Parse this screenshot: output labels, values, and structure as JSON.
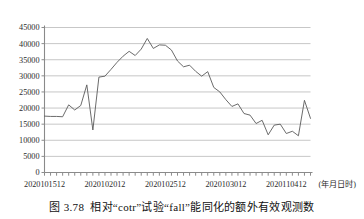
{
  "figure": {
    "caption_number": "图 3.78",
    "caption_text": "相对“cotr”试验“fall”能同化的额外有效观测数"
  },
  "chart_data": {
    "type": "line",
    "title": "",
    "xlabel": "(年月日时)",
    "ylabel": "",
    "ylim": [
      0,
      45000
    ],
    "ytick_values": [
      0,
      5000,
      10000,
      15000,
      20000,
      25000,
      30000,
      35000,
      40000,
      45000
    ],
    "ytick_labels": [
      "0",
      "5000",
      "10000",
      "15000",
      "20000",
      "25000",
      "30000",
      "35000",
      "40000",
      "45000"
    ],
    "xtick_labels": [
      "2020101512",
      "2020102012",
      "2020102512",
      "2020103012",
      "2020110412"
    ],
    "xtick_positions": [
      0,
      10,
      20,
      30,
      40
    ],
    "x_minor_tick_count": 45,
    "x_range": [
      0,
      44
    ],
    "grid": true,
    "legend": null,
    "series": [
      {
        "name": "fall",
        "color": "#5a5a5a",
        "x": [
          0,
          1,
          2,
          3,
          4,
          5,
          6,
          7,
          8,
          9,
          10,
          11,
          12,
          13,
          14,
          15,
          16,
          17,
          18,
          19,
          20,
          21,
          22,
          23,
          24,
          25,
          26,
          27,
          28,
          29,
          30,
          31,
          32,
          33,
          34,
          35,
          36,
          37,
          38,
          39,
          40,
          41,
          42,
          43,
          44
        ],
        "values": [
          17500,
          17400,
          17400,
          17300,
          21000,
          19400,
          20800,
          27200,
          13200,
          29600,
          29900,
          32000,
          34200,
          36100,
          37600,
          36300,
          38300,
          41600,
          38500,
          39600,
          39500,
          38000,
          34600,
          32800,
          33300,
          31400,
          29900,
          31300,
          26400,
          25000,
          22600,
          20500,
          21300,
          18300,
          17800,
          15200,
          16200,
          11700,
          14700,
          15000,
          12100,
          12800,
          11400,
          22400,
          16800
        ]
      }
    ]
  }
}
